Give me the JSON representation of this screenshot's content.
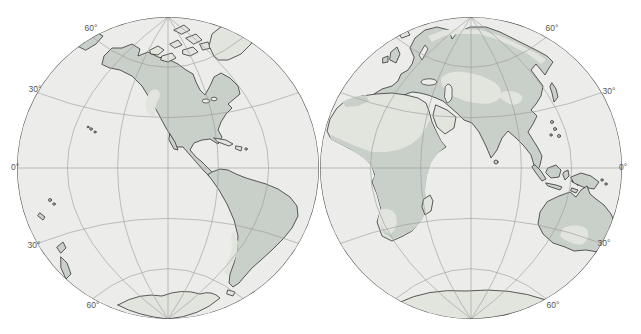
{
  "page": {
    "background": "#ffffff"
  },
  "map": {
    "description": "Double-hemisphere world map with shaded distribution regions",
    "colors": {
      "ocean": "#ecedea",
      "land_unshaded": "#e2e4de",
      "land_shaded": "#c9cfc9",
      "coastline": "#333333",
      "graticule": "#9a9a9a",
      "rim": "#4a4a4a",
      "label": "#555555",
      "page_bg": "#ffffff"
    },
    "graticule": {
      "parallels_deg": [
        30,
        60
      ],
      "meridians_deg": [
        30,
        60
      ],
      "equator": true,
      "central_meridian": true
    },
    "hemispheres": [
      {
        "name": "western",
        "cx": 168,
        "cy": 168,
        "r": 151,
        "labels": [
          {
            "text": "60°",
            "x": 91,
            "y": 31
          },
          {
            "text": "30°",
            "x": 35,
            "y": 92
          },
          {
            "text": "0°",
            "x": 15,
            "y": 170
          },
          {
            "text": "30°",
            "x": 34,
            "y": 248
          },
          {
            "text": "60°",
            "x": 93,
            "y": 308
          }
        ]
      },
      {
        "name": "eastern",
        "cx": 471,
        "cy": 168,
        "r": 151,
        "labels": [
          {
            "text": "60°",
            "x": 552,
            "y": 31
          },
          {
            "text": "30°",
            "x": 609,
            "y": 94
          },
          {
            "text": "0°",
            "x": 623,
            "y": 170
          },
          {
            "text": "30°",
            "x": 604,
            "y": 246
          },
          {
            "text": "60°",
            "x": 553,
            "y": 308
          }
        ]
      }
    ]
  }
}
